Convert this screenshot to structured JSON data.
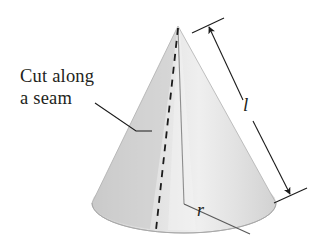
{
  "figure": {
    "width": 314,
    "height": 251,
    "background": "#ffffff"
  },
  "annotations": {
    "cut_note": {
      "line1": "Cut along",
      "line2": "a seam"
    },
    "slant_height_label": "l",
    "radius_label": "r"
  },
  "colors": {
    "ink": "#231f20",
    "cone_light": "#ececec",
    "cone_mid": "#dcdcdc",
    "cone_shadow": "#c9c9c9",
    "base_fill": "#d5d5d5",
    "outline": "#9a9a9a",
    "background": "#ffffff"
  },
  "geometry": {
    "apex": [
      178,
      26
    ],
    "base_center": [
      184,
      203
    ],
    "base_rx": 92,
    "base_ry": 30,
    "seam_dashed_from": [
      178,
      26
    ],
    "seam_dashed_to": [
      156,
      228
    ],
    "radius_line_from": [
      184,
      203
    ],
    "radius_line_to": [
      249,
      233
    ],
    "axis_line_from": [
      178,
      28
    ],
    "axis_line_to": [
      184,
      203
    ],
    "dimension_from": [
      208,
      25
    ],
    "dimension_to": [
      292,
      196
    ],
    "leader_from": [
      95,
      103
    ],
    "leader_elbow": [
      136,
      131
    ],
    "leader_to": [
      152,
      131
    ]
  },
  "shapes": {
    "cone_outline": "M 178 26 L 92 203 A 92 30 0 0 0 276 203 Z",
    "cone_left_face": "M 178 26 L 92 203 A 92 30 0 0 0 184 233 Z",
    "cone_right_face": "M 178 26 L 184 233 A 92 30 0 0 0 276 203 Z"
  }
}
